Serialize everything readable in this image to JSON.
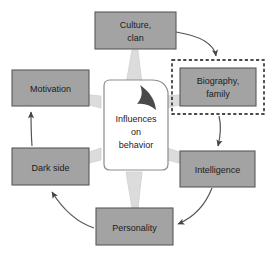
{
  "diagram": {
    "title_center": "Influences on behavior",
    "center": {
      "line1": "Influences",
      "line2": "on",
      "line3": "behavior",
      "fill": "#ffffff",
      "border": "#8c8c8c",
      "fold_mark": "folded-corner-swoosh"
    },
    "style": {
      "node_fill": "#a3a3a3",
      "node_stroke": "#5a5a5a",
      "wedge_fill": "#dcdcdc",
      "arrow_color": "#555555",
      "selection_color": "#111111",
      "background": "#ffffff",
      "text_color": "#1b1b1b"
    },
    "nodes": [
      {
        "id": "culture",
        "label_line1": "Culture,",
        "label_line2": "clan",
        "selected": false
      },
      {
        "id": "biography",
        "label_line1": "Biography,",
        "label_line2": "family",
        "selected": true
      },
      {
        "id": "intelligence",
        "label_line1": "Intelligence",
        "label_line2": "",
        "selected": false
      },
      {
        "id": "personality",
        "label_line1": "Personality",
        "label_line2": "",
        "selected": false
      },
      {
        "id": "darkside",
        "label_line1": "Dark side",
        "label_line2": "",
        "selected": false
      },
      {
        "id": "motivation",
        "label_line1": "Motivation",
        "label_line2": "",
        "selected": false
      }
    ],
    "flow_arrows": [
      {
        "from": "culture",
        "to": "biography"
      },
      {
        "from": "biography",
        "to": "intelligence"
      },
      {
        "from": "intelligence",
        "to": "personality"
      },
      {
        "from": "personality",
        "to": "darkside"
      },
      {
        "from": "darkside",
        "to": "motivation"
      }
    ],
    "spokes": [
      {
        "to": "culture"
      },
      {
        "to": "biography"
      },
      {
        "to": "intelligence"
      },
      {
        "to": "personality"
      },
      {
        "to": "darkside"
      },
      {
        "to": "motivation"
      }
    ]
  }
}
